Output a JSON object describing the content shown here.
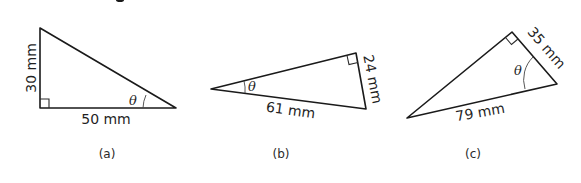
{
  "figure": {
    "partial_header_glyph": "g",
    "triangles": [
      {
        "id": "a",
        "caption": "(a)",
        "angle_label": "θ",
        "vertical_side": "30 mm",
        "horizontal_side": "50 mm",
        "right_angle_at": "bottom-left"
      },
      {
        "id": "b",
        "caption": "(b)",
        "angle_label": "θ",
        "short_side": "24 mm",
        "hypotenuse": "61 mm",
        "right_angle_at": "top-right"
      },
      {
        "id": "c",
        "caption": "(c)",
        "angle_label": "θ",
        "short_side": "35 mm",
        "hypotenuse": "79 mm",
        "right_angle_at": "top"
      }
    ]
  }
}
